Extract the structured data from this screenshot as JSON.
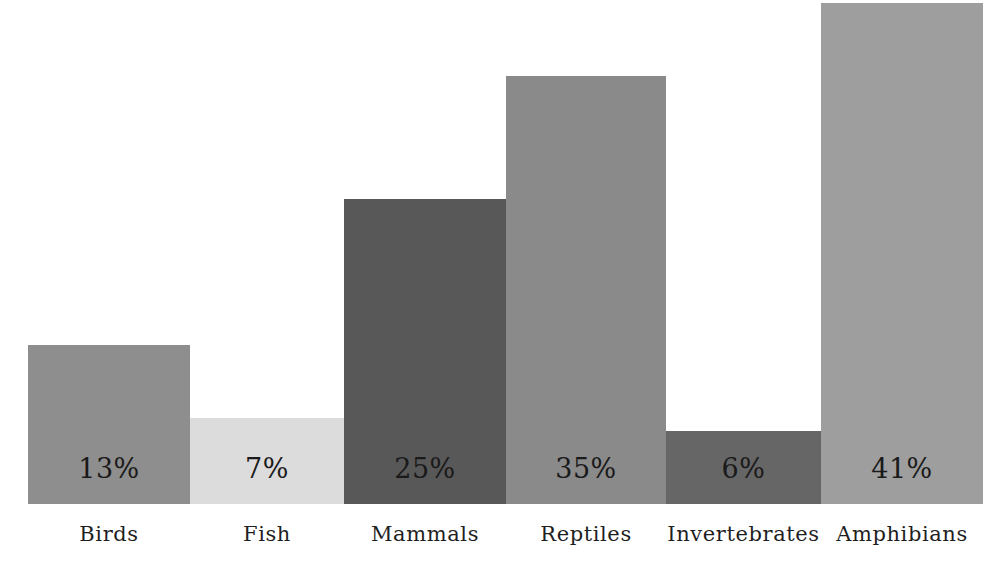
{
  "chart_data": {
    "type": "bar",
    "title": "",
    "subtitle": "",
    "xlabel": "",
    "ylabel": "",
    "categories": [
      "Birds",
      "Fish",
      "Mammals",
      "Reptiles",
      "Invertebrates",
      "Amphibians"
    ],
    "values": [
      13,
      7,
      25,
      35,
      6,
      41
    ],
    "value_labels": [
      "13%",
      "7%",
      "25%",
      "35%",
      "6%",
      "41%"
    ],
    "value_unit": "%",
    "ylim": [
      0,
      42
    ],
    "grid": false,
    "legend": "none",
    "axis_visible": false,
    "tick_labels_y": [],
    "bars": [
      {
        "category": "Birds",
        "value": 13,
        "label": "13%",
        "color": "#8e8e8e",
        "x": 28,
        "width": 162
      },
      {
        "category": "Fish",
        "value": 7,
        "label": "7%",
        "color": "#dcdcdc",
        "x": 190,
        "width": 154
      },
      {
        "category": "Mammals",
        "value": 25,
        "label": "25%",
        "color": "#585858",
        "x": 344,
        "width": 162
      },
      {
        "category": "Reptiles",
        "value": 35,
        "label": "35%",
        "color": "#8a8a8a",
        "x": 506,
        "width": 160
      },
      {
        "category": "Invertebrates",
        "value": 6,
        "label": "6%",
        "color": "#666666",
        "x": 666,
        "width": 155
      },
      {
        "category": "Amphibians",
        "value": 41,
        "label": "41%",
        "color": "#9e9e9e",
        "x": 821,
        "width": 162
      }
    ],
    "background_color": "#ffffff",
    "text_color": "#1a1a1a"
  }
}
